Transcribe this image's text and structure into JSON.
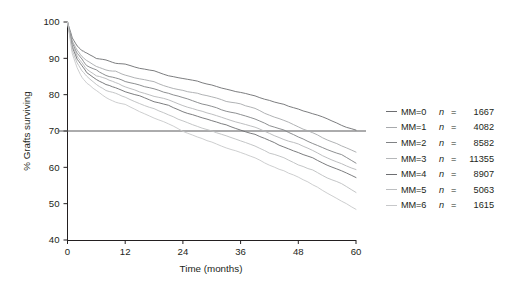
{
  "chart_data": {
    "type": "line",
    "title": "",
    "xlabel": "Time (months)",
    "ylabel": "% Grafts surviving",
    "xlim": [
      0,
      60
    ],
    "ylim": [
      40,
      100
    ],
    "xticks": [
      0,
      12,
      24,
      36,
      48,
      60
    ],
    "yticks": [
      40,
      50,
      60,
      70,
      80,
      90,
      100
    ],
    "grid": false,
    "legend_position": "right",
    "reference_lines": [
      {
        "orientation": "horizontal",
        "value": 70,
        "color": "#58595b"
      }
    ],
    "x": [
      0,
      1,
      2,
      3,
      4,
      6,
      8,
      10,
      12,
      15,
      18,
      21,
      24,
      27,
      30,
      33,
      36,
      39,
      42,
      45,
      48,
      51,
      54,
      57,
      60
    ],
    "series": [
      {
        "name": "MM=0",
        "n": 1667,
        "color": "#6d6e71",
        "values": [
          100,
          95.6,
          93.4,
          92.2,
          91.3,
          90.2,
          89.4,
          88.8,
          88.2,
          87.3,
          86.4,
          85.5,
          84.6,
          83.6,
          82.6,
          81.7,
          80.7,
          79.6,
          78.4,
          77.3,
          76.2,
          74.6,
          73.2,
          71.6,
          70.2
        ]
      },
      {
        "name": "MM=1",
        "n": 4082,
        "color": "#a7a9ac",
        "values": [
          100,
          94.8,
          92.2,
          90.6,
          89.4,
          88.0,
          87.0,
          86.2,
          85.5,
          84.4,
          83.3,
          82.2,
          81.1,
          80.1,
          79.2,
          78.3,
          77.4,
          76.0,
          74.4,
          72.8,
          71.2,
          69.4,
          67.6,
          65.8,
          64.0
        ]
      },
      {
        "name": "MM=2",
        "n": 8582,
        "color": "#808285",
        "values": [
          100,
          94.2,
          91.4,
          89.6,
          88.2,
          86.6,
          85.5,
          84.6,
          83.8,
          82.6,
          81.4,
          80.2,
          79.0,
          77.8,
          76.7,
          75.6,
          74.5,
          73.1,
          71.6,
          70.1,
          68.6,
          66.8,
          65.0,
          63.2,
          61.4
        ]
      },
      {
        "name": "MM=3",
        "n": 11355,
        "color": "#b5b7b9",
        "values": [
          100,
          93.6,
          90.6,
          88.7,
          87.2,
          85.4,
          84.2,
          83.2,
          82.4,
          81.0,
          79.7,
          78.4,
          77.1,
          75.8,
          74.6,
          73.4,
          72.2,
          70.8,
          69.3,
          67.8,
          66.3,
          64.6,
          62.8,
          61.1,
          59.4
        ]
      },
      {
        "name": "MM=4",
        "n": 8907,
        "color": "#6d6e71",
        "values": [
          100,
          93.0,
          89.8,
          87.8,
          86.2,
          84.3,
          83.0,
          82.0,
          81.1,
          79.6,
          78.2,
          76.8,
          75.4,
          74.1,
          72.8,
          71.5,
          70.2,
          68.8,
          67.3,
          65.8,
          64.3,
          62.6,
          60.8,
          59.1,
          57.4
        ]
      },
      {
        "name": "MM=5",
        "n": 5063,
        "color": "#bcbec0",
        "values": [
          100,
          92.2,
          88.7,
          86.5,
          84.8,
          82.7,
          81.3,
          80.2,
          79.2,
          77.6,
          76.0,
          74.4,
          72.9,
          71.4,
          70.0,
          68.6,
          67.2,
          65.7,
          64.1,
          62.5,
          60.9,
          59.0,
          57.1,
          55.3,
          53.4
        ]
      },
      {
        "name": "MM=6",
        "n": 1615,
        "color": "#c7c8ca",
        "values": [
          100,
          91.2,
          87.4,
          85.0,
          83.2,
          80.9,
          79.4,
          78.2,
          77.1,
          75.3,
          73.6,
          71.9,
          70.2,
          68.6,
          67.1,
          65.6,
          64.1,
          62.5,
          60.8,
          59.1,
          57.4,
          55.3,
          53.1,
          50.9,
          48.6
        ]
      }
    ]
  },
  "axes": {
    "ylabel": "% Grafts surviving",
    "xlabel": "Time (months)",
    "xtick_labels": [
      "0",
      "12",
      "24",
      "36",
      "48",
      "60"
    ],
    "ytick_labels": [
      "40",
      "50",
      "60",
      "70",
      "80",
      "90",
      "100"
    ]
  },
  "legend": {
    "rows": [
      {
        "label": "MM=0",
        "n_symbol": "n",
        "eq": "=",
        "value": "1667"
      },
      {
        "label": "MM=1",
        "n_symbol": "n",
        "eq": "=",
        "value": "4082"
      },
      {
        "label": "MM=2",
        "n_symbol": "n",
        "eq": "=",
        "value": "8582"
      },
      {
        "label": "MM=3",
        "n_symbol": "n",
        "eq": "=",
        "value": "11355"
      },
      {
        "label": "MM=4",
        "n_symbol": "n",
        "eq": "=",
        "value": "8907"
      },
      {
        "label": "MM=5",
        "n_symbol": "n",
        "eq": "=",
        "value": "5063"
      },
      {
        "label": "MM=6",
        "n_symbol": "n",
        "eq": "=",
        "value": "1615"
      }
    ]
  }
}
